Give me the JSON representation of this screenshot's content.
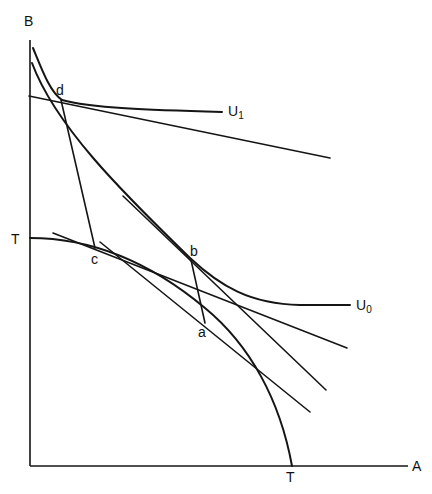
{
  "diagram": {
    "type": "trade-theory indifference / production possibility diagram",
    "axes": {
      "y_label": "B",
      "x_label": "A",
      "y_intercept_label": "T",
      "x_intercept_label": "T"
    },
    "curves": {
      "ppf": {
        "name": "production possibility frontier",
        "endpoints": [
          "T",
          "T"
        ]
      },
      "u0": {
        "label": "U",
        "subscript": "0"
      },
      "u1": {
        "label": "U",
        "subscript": "1"
      }
    },
    "points": {
      "a": "a",
      "b": "b",
      "c": "c",
      "d": "d"
    },
    "colors": {
      "ink": "#151515",
      "background": "#ffffff"
    }
  }
}
